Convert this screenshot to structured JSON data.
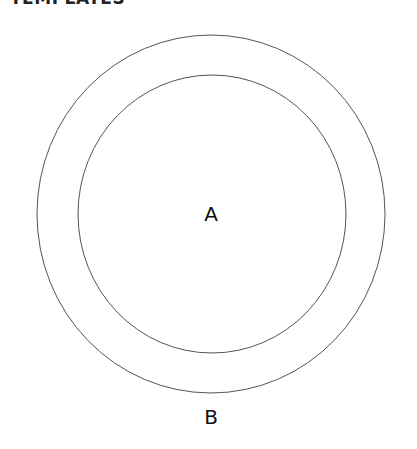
{
  "header": {
    "title": "TEMPLATES"
  },
  "diagram": {
    "outer_circle": {
      "cx": 211,
      "cy": 214,
      "rx": 174,
      "ry": 179,
      "stroke": "#555555"
    },
    "inner_circle": {
      "cx": 212,
      "cy": 214,
      "rx": 134,
      "ry": 139,
      "stroke": "#555555"
    },
    "label_inner": "A",
    "label_outer": "B"
  }
}
